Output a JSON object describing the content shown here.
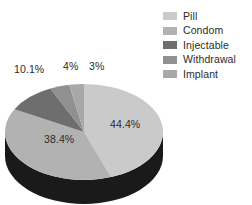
{
  "chart_data": {
    "type": "pie",
    "title": "",
    "xlabel": "",
    "ylabel": "",
    "legend_position": "top-right",
    "three_d": true,
    "categories": [
      "Pill",
      "Condom",
      "Injectable",
      "Withdrawal",
      "Implant"
    ],
    "values": [
      44.4,
      38.4,
      10.1,
      4,
      3
    ],
    "value_labels": [
      "44.4%",
      "38.4%",
      "10.1%",
      "4%",
      "3%"
    ],
    "colors": [
      "#cacaca",
      "#b2b2b2",
      "#6e6e6e",
      "#909090",
      "#a8a8a8"
    ],
    "side_wall_color": "#1a1a1a",
    "label_color": "#2b2b2b"
  },
  "legend": {
    "items": [
      {
        "label": "Pill",
        "color": "#cacaca"
      },
      {
        "label": "Condom",
        "color": "#b2b2b2"
      },
      {
        "label": "Injectable",
        "color": "#6e6e6e"
      },
      {
        "label": "Withdrawal",
        "color": "#909090"
      },
      {
        "label": "Implant",
        "color": "#a8a8a8"
      }
    ]
  },
  "labels": {
    "pill": "44.4%",
    "condom": "38.4%",
    "injectable": "10.1%",
    "withdrawal": "4%",
    "implant": "3%"
  }
}
